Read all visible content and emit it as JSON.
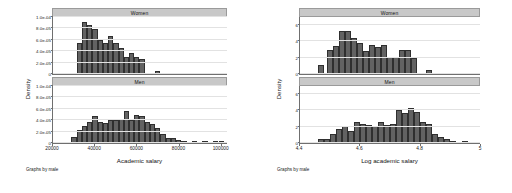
{
  "figures": [
    {
      "id": "salary-histogram",
      "note": "Graphs by male",
      "ylabel": "Density",
      "xlabel": "Academic salary",
      "xticks": [
        "20000",
        "40000",
        "60000",
        "80000",
        "100000"
      ],
      "yticks": [
        "0",
        "2.0e-05",
        "4.0e-05",
        "6.0e-05",
        "8.0e-05",
        "1.0e-04"
      ],
      "panels": [
        {
          "title": "Women"
        },
        {
          "title": "Men"
        }
      ]
    },
    {
      "id": "log-salary-histogram",
      "note": "Graphs by male",
      "ylabel": "Density",
      "xlabel": "Log academic salary",
      "xticks": [
        "4.4",
        "4.6",
        "4.8",
        "5"
      ],
      "yticks": [
        "0",
        "2",
        "4",
        "6"
      ],
      "panels": [
        {
          "title": "Women"
        },
        {
          "title": "Men"
        }
      ]
    }
  ],
  "chart_data": [
    {
      "type": "bar",
      "title": "Density of academic salary by sex",
      "subtitle": "Graphs by male",
      "xlabel": "Academic salary",
      "ylabel": "Density",
      "xlim": [
        20000,
        103000
      ],
      "ylim": [
        0,
        0.0001
      ],
      "xticks": [
        20000,
        40000,
        60000,
        80000,
        100000
      ],
      "yticks": [
        0,
        2e-05,
        4e-05,
        6e-05,
        8e-05,
        0.0001
      ],
      "grid": true,
      "legend_position": "none",
      "panels": [
        {
          "name": "Women",
          "bin_width": 2500,
          "x": [
            32500,
            35000,
            37500,
            40000,
            42500,
            45000,
            47500,
            50000,
            52500,
            55000,
            57500,
            60000,
            62500,
            70000
          ],
          "values": [
            5.45e-05,
            9.05e-05,
            8.65e-05,
            7.9e-05,
            6.05e-05,
            5.5e-05,
            6.6e-05,
            5.45e-05,
            4.5e-05,
            3e-05,
            3.65e-05,
            3e-05,
            2.55e-05,
            5.5e-06
          ]
        },
        {
          "name": "Men",
          "bin_width": 2500,
          "x": [
            30000,
            32500,
            35000,
            37500,
            40000,
            42500,
            45000,
            47500,
            50000,
            52500,
            55000,
            57500,
            60000,
            62500,
            65000,
            67500,
            70000,
            72500,
            75000,
            77500,
            80000,
            82500,
            87500,
            92500,
            97500,
            100500
          ],
          "values": [
            1.1e-05,
            2.3e-05,
            3e-05,
            3.7e-05,
            4.8e-05,
            3.6e-05,
            3.45e-05,
            4e-05,
            4e-05,
            4.2e-05,
            5.55e-05,
            4e-05,
            5e-05,
            4.8e-05,
            3.75e-05,
            3.4e-05,
            2.6e-05,
            1.65e-05,
            9e-06,
            9e-06,
            5.5e-06,
            3e-06,
            4e-06,
            3.5e-06,
            3e-06,
            2.5e-06
          ]
        }
      ]
    },
    {
      "type": "bar",
      "title": "Density of log academic salary by sex",
      "subtitle": "Graphs by male",
      "xlabel": "Log academic salary",
      "ylabel": "Density",
      "xlim": [
        4.4,
        5.0
      ],
      "ylim": [
        0,
        7.0
      ],
      "xticks": [
        4.4,
        4.6,
        4.8,
        5.0
      ],
      "yticks": [
        0,
        2,
        4,
        6
      ],
      "grid": true,
      "legend_position": "none",
      "panels": [
        {
          "name": "Women",
          "bin_width": 0.02,
          "x": [
            4.47,
            4.5,
            4.52,
            4.54,
            4.56,
            4.58,
            4.6,
            4.62,
            4.64,
            4.66,
            4.68,
            4.7,
            4.72,
            4.74,
            4.76,
            4.78,
            4.83
          ],
          "values": [
            1.05,
            2.95,
            3.45,
            5.25,
            5.25,
            4.45,
            3.75,
            2.85,
            3.55,
            3.35,
            3.6,
            2.05,
            2.05,
            2.95,
            2.95,
            1.95,
            0.45
          ]
        },
        {
          "name": "Men",
          "bin_width": 0.02,
          "x": [
            4.47,
            4.49,
            4.51,
            4.53,
            4.55,
            4.57,
            4.59,
            4.61,
            4.63,
            4.65,
            4.67,
            4.69,
            4.71,
            4.73,
            4.75,
            4.77,
            4.79,
            4.81,
            4.83,
            4.85,
            4.87,
            4.89,
            4.91,
            4.95
          ],
          "values": [
            0.55,
            0.45,
            1.15,
            1.7,
            2.1,
            1.5,
            2.55,
            2.3,
            2.25,
            2.05,
            2.55,
            2.25,
            2.35,
            4.1,
            3.65,
            4.3,
            3.85,
            2.6,
            2.35,
            1.15,
            0.75,
            0.45,
            0.3,
            0.12
          ]
        }
      ]
    }
  ]
}
